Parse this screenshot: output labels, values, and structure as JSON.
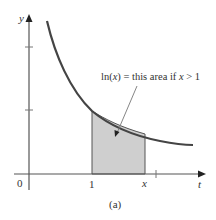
{
  "figure": {
    "caption": "(a)",
    "annotation": "ln(x) = this area if x > 1",
    "annotation_parts": {
      "pre": "ln(",
      "var": "x",
      "mid": ") = this area if ",
      "var2": "x",
      "post": " > 1"
    },
    "axes": {
      "x_label": "t",
      "y_label": "y",
      "origin_label": "0",
      "x_tick_labels": [
        "1",
        "x"
      ]
    },
    "curve": "y = 1/t",
    "shaded_region": {
      "from": "1",
      "to": "x"
    },
    "colors": {
      "axis": "#555555",
      "curve": "#444444",
      "shade": "#cfcfcf",
      "text": "#333333"
    }
  }
}
